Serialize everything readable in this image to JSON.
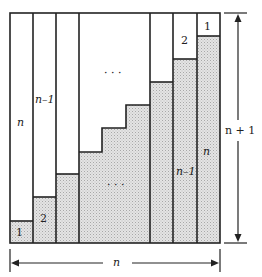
{
  "diagram": {
    "title": "",
    "type": "staircase proof of sum of integers",
    "colors": {
      "stroke": "#222222",
      "fill_shaded": "#d9d9d9",
      "fill_blank": "#ffffff"
    },
    "grid": {
      "columns": [
        {
          "id": "c1",
          "x0": 10,
          "x1": 33,
          "split_y": 221,
          "top_label": "n",
          "bottom_label": "1"
        },
        {
          "id": "c2",
          "x0": 33,
          "x1": 56,
          "split_y": 197,
          "top_label": "n–1",
          "bottom_label": "2"
        },
        {
          "id": "c3",
          "x0": 56,
          "x1": 79,
          "split_y": 174,
          "top_label": "",
          "bottom_label": ""
        },
        {
          "id": "c_mid",
          "x0": 79,
          "x1": 150,
          "stairs": [
            [
              79,
              152
            ],
            [
              102,
              152
            ],
            [
              102,
              128
            ],
            [
              126,
              128
            ],
            [
              126,
              105
            ],
            [
              150,
              105
            ]
          ],
          "top_label": "…",
          "bottom_label": "…"
        },
        {
          "id": "c4",
          "x0": 150,
          "x1": 173,
          "split_y": 82,
          "top_label": "",
          "bottom_label": ""
        },
        {
          "id": "c5",
          "x0": 173,
          "x1": 197,
          "split_y": 59,
          "top_label": "2",
          "bottom_label": "n–1"
        },
        {
          "id": "c6",
          "x0": 197,
          "x1": 220,
          "split_y": 36,
          "top_label": "1",
          "bottom_label": "n"
        }
      ],
      "box": {
        "x0": 10,
        "y0": 13,
        "x1": 220,
        "y1": 243
      }
    },
    "labels": {
      "col1_top": "n",
      "col2_top": "n–1",
      "mid_top_dots": "· · ·",
      "col5_top": "2",
      "col6_top": "1",
      "col1_bottom": "1",
      "col2_bottom": "2",
      "mid_bottom_dots": "· · ·",
      "col5_bottom": "n–1",
      "col6_bottom": "n",
      "height_dim": "n + 1",
      "width_dim": "n"
    }
  }
}
